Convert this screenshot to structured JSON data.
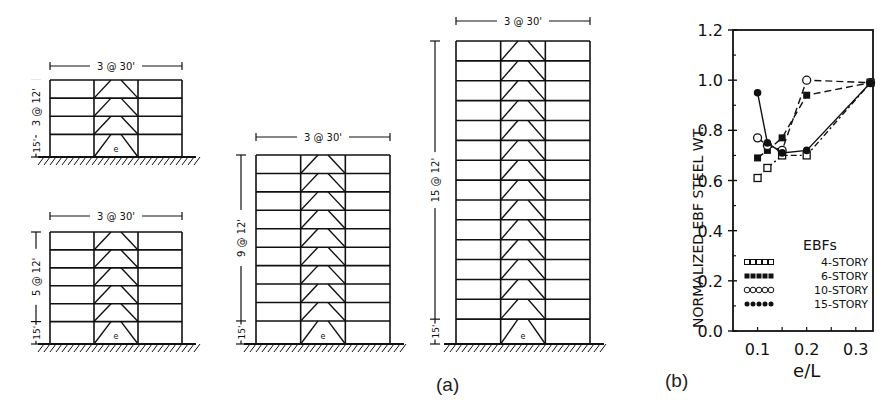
{
  "figure": {
    "part_a_label": "(a)",
    "part_b_label": "(b)",
    "frames": [
      {
        "id": "4-story",
        "bays_label": "3 @ 30'",
        "height_label_upper": "3 @ 12'",
        "height_label_lower": "15'",
        "stories": 4,
        "link_label": "e"
      },
      {
        "id": "6-story",
        "bays_label": "3 @ 30'",
        "height_label_upper": "5 @ 12'",
        "height_label_lower": "15'",
        "stories": 6,
        "link_label": "e"
      },
      {
        "id": "10-story",
        "bays_label": "3 @ 30'",
        "height_label_upper": "9 @ 12'",
        "height_label_lower": "15'",
        "stories": 10,
        "link_label": "e"
      },
      {
        "id": "15-story",
        "bays_label": "3 @ 30'",
        "height_label_upper": "15 @ 12'",
        "height_label_lower": "15'",
        "stories": 15,
        "link_label": "e"
      }
    ]
  },
  "chart_data": {
    "type": "line",
    "title": "",
    "xlabel": "e/L",
    "ylabel": "NORMALIZED EBF STEEL WT.",
    "xlim": [
      0.05,
      0.335
    ],
    "ylim": [
      0.0,
      1.2
    ],
    "xticks": [
      "0.1",
      "0.2",
      "0.3"
    ],
    "yticks": [
      "0.0",
      "0.2",
      "0.4",
      "0.6",
      "0.8",
      "1.0",
      "1.2"
    ],
    "grid": false,
    "legend_title": "EBFs",
    "legend_position": "lower right",
    "series": [
      {
        "name": "4-STORY",
        "marker": "open-square",
        "line": "dash-dot",
        "x": [
          0.1,
          0.12,
          0.15,
          0.2,
          0.33
        ],
        "values": [
          0.61,
          0.65,
          0.7,
          0.7,
          0.99
        ]
      },
      {
        "name": "6-STORY",
        "marker": "filled-square",
        "line": "dashed",
        "x": [
          0.1,
          0.12,
          0.15,
          0.2,
          0.33
        ],
        "values": [
          0.69,
          0.72,
          0.77,
          0.94,
          0.99
        ]
      },
      {
        "name": "10-STORY",
        "marker": "open-circle",
        "line": "dashed",
        "x": [
          0.1,
          0.12,
          0.15,
          0.2,
          0.33
        ],
        "values": [
          0.77,
          0.74,
          0.72,
          1.0,
          0.99
        ]
      },
      {
        "name": "15-STORY",
        "marker": "filled-circle",
        "line": "solid",
        "x": [
          0.1,
          0.12,
          0.15,
          0.2,
          0.33
        ],
        "values": [
          0.95,
          0.75,
          0.71,
          0.72,
          0.99
        ]
      }
    ]
  }
}
